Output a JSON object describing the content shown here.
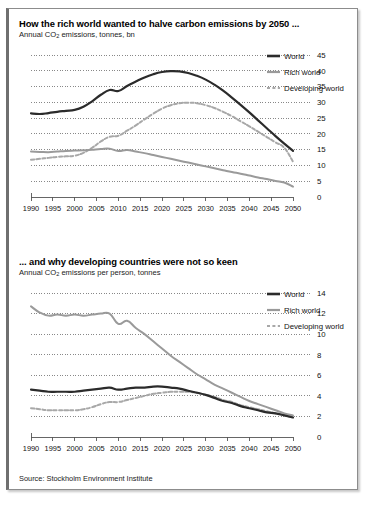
{
  "source_note": "Source: Stockholm Environment Institute",
  "colors": {
    "world": "#2b2b2b",
    "rich_world": "#9a9a9a",
    "developing_world": "#a8a8a8",
    "gridline": "#555555",
    "axis": "#555555",
    "frame": "#8c8c8c",
    "frame_left": "#6f6f6f",
    "background": "#ffffff"
  },
  "legend": {
    "items": [
      {
        "label": "World",
        "style": "solid-thick",
        "color": "#2b2b2b"
      },
      {
        "label": "Rich world",
        "style": "solid",
        "color": "#9a9a9a"
      },
      {
        "label": "Developing world",
        "style": "dashed",
        "color": "#a8a8a8"
      }
    ]
  },
  "chart_data": [
    {
      "type": "line",
      "title": "How the rich world wanted to halve carbon emissions by 2050 ...",
      "subtitle": "Annual CO2 emissions, tonnes, bn",
      "subtitle_prefix": "Annual CO",
      "subtitle_sub": "2",
      "subtitle_suffix": " emissions, tonnes, bn",
      "xlabel": "",
      "ylabel": "",
      "ylim": [
        0,
        45
      ],
      "yticks": [
        0,
        5,
        10,
        15,
        20,
        25,
        30,
        35,
        40,
        45
      ],
      "xlim": [
        1990,
        2050
      ],
      "xticks": [
        1990,
        1995,
        2000,
        2005,
        2010,
        2015,
        2020,
        2025,
        2030,
        2035,
        2040,
        2045,
        2050
      ],
      "grid": true,
      "legend_position": "top-right",
      "x": [
        1990,
        1992,
        1994,
        1996,
        1998,
        2000,
        2002,
        2004,
        2006,
        2008,
        2010,
        2012,
        2014,
        2016,
        2018,
        2020,
        2022,
        2024,
        2026,
        2028,
        2030,
        2032,
        2034,
        2036,
        2038,
        2040,
        2042,
        2044,
        2046,
        2048,
        2050
      ],
      "series": [
        {
          "name": "World",
          "style": "solid-thick",
          "color": "#2b2b2b",
          "values": [
            26.5,
            26.3,
            26.6,
            27.0,
            27.3,
            27.6,
            28.6,
            30.3,
            32.4,
            33.9,
            33.6,
            35.2,
            36.6,
            37.9,
            38.9,
            39.6,
            39.9,
            39.8,
            39.3,
            38.4,
            37.2,
            35.6,
            33.7,
            31.5,
            29.2,
            26.8,
            24.3,
            21.8,
            19.3,
            16.9,
            14.6
          ]
        },
        {
          "name": "Rich world",
          "style": "solid",
          "color": "#9a9a9a",
          "values": [
            14.4,
            14.3,
            14.2,
            14.4,
            14.6,
            14.7,
            14.8,
            15.0,
            15.2,
            15.3,
            14.6,
            14.9,
            14.4,
            13.9,
            13.3,
            12.7,
            12.1,
            11.5,
            10.9,
            10.3,
            9.7,
            9.1,
            8.5,
            7.9,
            7.4,
            6.8,
            6.2,
            5.7,
            5.1,
            4.6,
            3.3
          ]
        },
        {
          "name": "Developing world",
          "style": "dashed",
          "color": "#a8a8a8",
          "values": [
            11.8,
            12.1,
            12.4,
            12.7,
            12.9,
            13.1,
            14.0,
            15.6,
            17.6,
            19.1,
            19.4,
            21.0,
            22.7,
            24.6,
            26.4,
            28.0,
            29.1,
            29.7,
            29.9,
            29.7,
            29.1,
            28.2,
            27.0,
            25.6,
            24.0,
            22.4,
            20.7,
            19.0,
            17.3,
            15.6,
            11.2
          ]
        }
      ]
    },
    {
      "type": "line",
      "title": "... and why developing countries were not so keen",
      "subtitle": "Annual CO2 emissions per person, tonnes",
      "subtitle_prefix": "Annual CO",
      "subtitle_sub": "2",
      "subtitle_suffix": " emissions per person, tonnes",
      "xlabel": "",
      "ylabel": "",
      "ylim": [
        0,
        14
      ],
      "yticks": [
        0,
        2,
        4,
        6,
        8,
        10,
        12,
        14
      ],
      "xlim": [
        1990,
        2050
      ],
      "xticks": [
        1990,
        1995,
        2000,
        2005,
        2010,
        2015,
        2020,
        2025,
        2030,
        2035,
        2040,
        2045,
        2050
      ],
      "grid": true,
      "legend_position": "top-right",
      "x": [
        1990,
        1992,
        1994,
        1996,
        1998,
        2000,
        2002,
        2004,
        2006,
        2008,
        2010,
        2012,
        2014,
        2016,
        2018,
        2020,
        2022,
        2024,
        2026,
        2028,
        2030,
        2032,
        2034,
        2036,
        2038,
        2040,
        2042,
        2044,
        2046,
        2048,
        2050
      ],
      "series": [
        {
          "name": "World",
          "style": "solid-thick",
          "color": "#2b2b2b",
          "values": [
            4.6,
            4.5,
            4.4,
            4.4,
            4.4,
            4.4,
            4.5,
            4.6,
            4.7,
            4.8,
            4.6,
            4.7,
            4.8,
            4.8,
            4.9,
            4.9,
            4.8,
            4.7,
            4.5,
            4.3,
            4.1,
            3.8,
            3.5,
            3.3,
            3.0,
            2.8,
            2.6,
            2.4,
            2.3,
            2.1,
            1.9
          ]
        },
        {
          "name": "Rich world",
          "style": "solid",
          "color": "#9a9a9a",
          "values": [
            12.7,
            12.1,
            11.8,
            11.9,
            11.8,
            11.9,
            11.8,
            11.9,
            12.0,
            12.0,
            11.0,
            11.3,
            10.6,
            10.0,
            9.3,
            8.6,
            7.9,
            7.3,
            6.7,
            6.1,
            5.6,
            5.1,
            4.7,
            4.3,
            3.9,
            3.5,
            3.2,
            2.9,
            2.6,
            2.3,
            2.1
          ]
        },
        {
          "name": "Developing world",
          "style": "dashed",
          "color": "#a8a8a8",
          "values": [
            2.8,
            2.7,
            2.6,
            2.6,
            2.6,
            2.6,
            2.7,
            2.9,
            3.2,
            3.4,
            3.4,
            3.6,
            3.8,
            4.0,
            4.2,
            4.3,
            4.4,
            4.4,
            4.4,
            4.3,
            4.1,
            3.9,
            3.6,
            3.4,
            3.1,
            2.9,
            2.7,
            2.5,
            2.3,
            2.1,
            1.9
          ]
        }
      ]
    }
  ]
}
